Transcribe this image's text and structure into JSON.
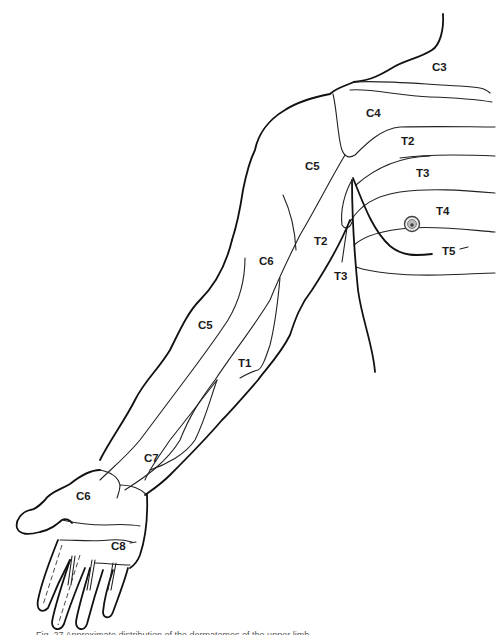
{
  "figure": {
    "caption_visible": "Fig. 27 Approximate distribution of the dermatomes of the upper limb"
  },
  "labels": {
    "c3": "C3",
    "c4": "C4",
    "t2_chest": "T2",
    "t3_chest": "T3",
    "t4": "T4",
    "t5": "T5",
    "c5_upper": "C5",
    "t2_arm": "T2",
    "t3_arm": "T3",
    "c6_arm": "C6",
    "c5_forearm": "C5",
    "t1": "T1",
    "c7": "C7",
    "c6_hand": "C6",
    "c8": "C8"
  },
  "colors": {
    "line": "#111111",
    "background": "#ffffff"
  }
}
